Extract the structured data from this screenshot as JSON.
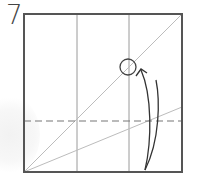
{
  "step": {
    "number": "7"
  },
  "diagram": {
    "colors": {
      "border": "#555555",
      "crease": "#999999",
      "diagonal": "#b5b5b5",
      "dashed": "#777777",
      "arrow": "#333333",
      "circle": "#444444"
    },
    "elements": [
      "square-paper-outline",
      "vertical-crease-left-third",
      "vertical-crease-right-third",
      "diagonal-crease",
      "shallow-diagonal-crease",
      "valley-fold-dashed-line",
      "target-point-circle",
      "fold-up-arrow"
    ]
  }
}
